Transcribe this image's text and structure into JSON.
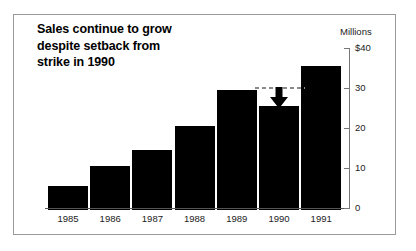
{
  "figure": {
    "title_lines": [
      "Sales continue to grow",
      "despite setback from",
      "strike in 1990"
    ],
    "background_color": "#ffffff",
    "bar_color": "#000000",
    "frame_color": "#9a9a9a"
  },
  "annotation": {
    "arrow_name": "down-arrow",
    "arrow_color": "#000000",
    "reference_line_color": "#8a8a8a",
    "reference_value": 30,
    "points_at_category": "1990"
  },
  "chart_data": {
    "type": "bar",
    "title": "Sales continue to grow despite setback from strike in 1990",
    "categories": [
      "1985",
      "1986",
      "1987",
      "1988",
      "1989",
      "1990",
      "1991"
    ],
    "values": [
      6,
      11,
      15,
      21,
      30,
      26,
      36
    ],
    "xlabel": "",
    "ylabel": "Millions",
    "ylim": [
      0,
      40
    ],
    "ytick_values": [
      0,
      10,
      20,
      30,
      40
    ],
    "ytick_labels": [
      "0",
      "10",
      "20",
      "30",
      "$40"
    ],
    "grid": false,
    "legend": false,
    "series": [
      {
        "name": "Sales",
        "values": [
          6,
          11,
          15,
          21,
          30,
          26,
          36
        ]
      }
    ],
    "annotations": [
      {
        "type": "arrow",
        "category": "1990",
        "from_value": 30,
        "to_value": 26,
        "note": "setback from strike"
      }
    ]
  }
}
